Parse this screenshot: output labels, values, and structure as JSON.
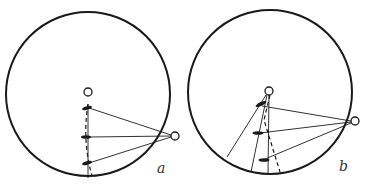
{
  "figure": {
    "panels": [
      {
        "id": "a",
        "label": "a"
      },
      {
        "id": "b",
        "label": "b"
      }
    ]
  },
  "colors": {
    "stroke": "#1a1a1a",
    "background": "#ffffff"
  }
}
